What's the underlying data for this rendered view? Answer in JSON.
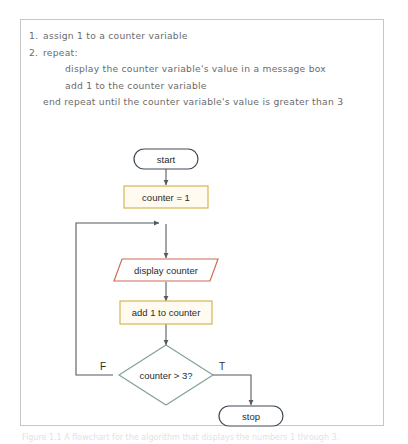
{
  "figure": {
    "caption": "Figure 1.1 A flowchart for the algorithm that displays the numbers 1 through 3."
  },
  "pseudocode": {
    "lines": [
      {
        "num": "1.",
        "text": "assign 1 to a counter variable",
        "indent": 0
      },
      {
        "num": "2.",
        "text": "repeat:",
        "indent": 0
      },
      {
        "num": "",
        "text": "display the counter variable's value in a message box",
        "indent": 2
      },
      {
        "num": "",
        "text": "add 1 to the counter variable",
        "indent": 2
      },
      {
        "num": "",
        "text": "end repeat until the counter variable's value is greater than 3",
        "indent": 1
      }
    ]
  },
  "flowchart": {
    "nodes": {
      "start": {
        "label": "start",
        "shape": "terminator"
      },
      "init": {
        "label": "counter = 1",
        "shape": "process"
      },
      "display": {
        "label": "display counter",
        "shape": "input-output"
      },
      "add": {
        "label": "add 1 to counter",
        "shape": "process"
      },
      "decide": {
        "label": "counter > 3?",
        "shape": "decision"
      },
      "stop": {
        "label": "stop",
        "shape": "terminator"
      }
    },
    "edge_labels": {
      "false": "F",
      "true": "T"
    }
  },
  "colors": {
    "terminator_stroke": "#3f4a56",
    "process_stroke": "#d6b656",
    "process_fill": "#fffbf0",
    "io_stroke": "#d06b52",
    "io_fill": "#ffffff",
    "decision_stroke": "#82a396",
    "decision_fill": "#ffffff",
    "connector": "#555b61",
    "frame_border": "#c6c6c6",
    "text": "#2b2b2b",
    "pseudocode_text": "#6b6b6b"
  }
}
